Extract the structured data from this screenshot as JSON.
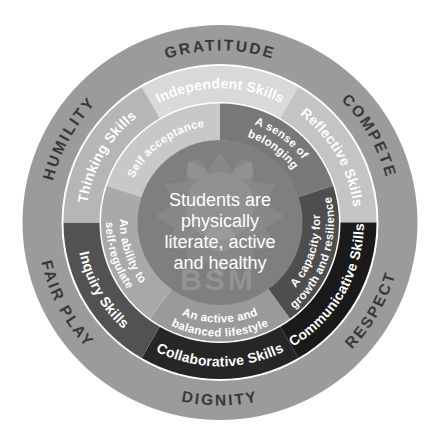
{
  "diagram": {
    "center": {
      "lines": [
        "Students are",
        "physically",
        "literate, active",
        "and healthy"
      ],
      "watermark": "BSM",
      "color": "#7f7f7f",
      "text_color": "#ffffff"
    },
    "inner_ring": {
      "text_color": "#ffffff",
      "segments": [
        {
          "lines": [
            "Self acceptance"
          ],
          "start": 288,
          "end": 360,
          "color": "#c8c8c8"
        },
        {
          "lines": [
            "A sense of",
            "belonging"
          ],
          "start": 0,
          "end": 72,
          "color": "#787878"
        },
        {
          "lines": [
            "A capacity for",
            "growth and resilience"
          ],
          "start": 72,
          "end": 144,
          "color": "#4e4e4e"
        },
        {
          "lines": [
            "An active and",
            "balanced lifestyle"
          ],
          "start": 144,
          "end": 216,
          "color": "#9a9a9a"
        },
        {
          "lines": [
            "An ability to",
            "self-regulate"
          ],
          "start": 216,
          "end": 288,
          "color": "#a9a9a9"
        }
      ]
    },
    "skills_ring": {
      "text_color": "#ffffff",
      "segments": [
        {
          "label": "Independent Skills",
          "start": -30,
          "end": 30,
          "color": "#d9d9d9"
        },
        {
          "label": "Reflective Skills",
          "start": 30,
          "end": 90,
          "color": "#c4c4c4"
        },
        {
          "label": "Communicative Skills",
          "start": 90,
          "end": 150,
          "color": "#1a1a1a"
        },
        {
          "label": "Collaborative Skills",
          "start": 150,
          "end": 210,
          "color": "#262626"
        },
        {
          "label": "Inquiry Skills",
          "start": 210,
          "end": 270,
          "color": "#525252"
        },
        {
          "label": "Thinking Skills",
          "start": 270,
          "end": 330,
          "color": "#b6b6b6"
        }
      ]
    },
    "outer_ring": {
      "color": "#9b9b9b",
      "text_color": "#373737",
      "labels": [
        {
          "text": "GRATITUDE",
          "angle": 0
        },
        {
          "text": "COMPETE",
          "angle": 60
        },
        {
          "text": "RESPECT",
          "angle": 120
        },
        {
          "text": "DIGNITY",
          "angle": 180
        },
        {
          "text": "FAIR PLAY",
          "angle": 242
        },
        {
          "text": "HUMILITY",
          "angle": 299
        }
      ]
    }
  }
}
